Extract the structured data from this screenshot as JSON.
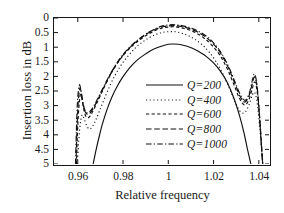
{
  "chart_data": {
    "type": "line",
    "title": "",
    "xlabel": "Relative frequency",
    "ylabel": "Insertion loss in dB",
    "xlim": [
      0.9495,
      1.0445
    ],
    "ylim": [
      0,
      5
    ],
    "y_inverted": true,
    "grid": false,
    "legend_position": "center",
    "xticks": [
      {
        "value": 0.96,
        "label": "0.96"
      },
      {
        "value": 0.98,
        "label": "0.98"
      },
      {
        "value": 1.0,
        "label": "1"
      },
      {
        "value": 1.02,
        "label": "1.02"
      },
      {
        "value": 1.04,
        "label": "1.04"
      }
    ],
    "yticks": [
      {
        "value": 0,
        "label": "0"
      },
      {
        "value": 0.5,
        "label": "0.5"
      },
      {
        "value": 1,
        "label": "1"
      },
      {
        "value": 1.5,
        "label": "1.5"
      },
      {
        "value": 2,
        "label": "2"
      },
      {
        "value": 2.5,
        "label": "2.5"
      },
      {
        "value": 3,
        "label": "3"
      },
      {
        "value": 3.5,
        "label": "3.5"
      },
      {
        "value": 4,
        "label": "4"
      },
      {
        "value": 4.5,
        "label": "4.5"
      },
      {
        "value": 5,
        "label": "5"
      }
    ],
    "series": [
      {
        "name": "Q=200",
        "label": "Q=200",
        "dash": "none",
        "color": "#111111",
        "x": [
          0.9668,
          0.968,
          0.9695,
          0.971,
          0.973,
          0.975,
          0.9775,
          0.98,
          0.983,
          0.986,
          0.989,
          0.992,
          0.995,
          0.998,
          1.0,
          1.002,
          1.0045,
          1.007,
          1.0095,
          1.012,
          1.0145,
          1.017,
          1.02,
          1.023,
          1.026,
          1.029,
          1.0315,
          1.0335,
          1.035,
          1.0365
        ],
        "y": [
          5.0,
          4.55,
          4.05,
          3.6,
          3.12,
          2.72,
          2.33,
          2.01,
          1.7,
          1.46,
          1.28,
          1.13,
          1.02,
          0.94,
          0.9,
          0.89,
          0.9,
          0.94,
          1.0,
          1.09,
          1.2,
          1.33,
          1.54,
          1.82,
          2.2,
          2.75,
          3.35,
          3.95,
          4.5,
          5.0
        ]
      },
      {
        "name": "Q=400",
        "label": "Q=400",
        "dash": "dotted",
        "color": "#111111",
        "x": [
          0.9598,
          0.9603,
          0.9608,
          0.9614,
          0.962,
          0.9628,
          0.9638,
          0.965,
          0.9663,
          0.9678,
          0.9695,
          0.9715,
          0.974,
          0.9765,
          0.979,
          0.982,
          0.985,
          0.988,
          0.991,
          0.994,
          0.997,
          1.0,
          1.003,
          1.006,
          1.009,
          1.012,
          1.015,
          1.018,
          1.021,
          1.024,
          1.027,
          1.0295,
          1.032,
          1.034,
          1.0358,
          1.0372,
          1.0382,
          1.039,
          1.0398,
          1.0405,
          1.0412,
          1.0418
        ],
        "y": [
          5.0,
          4.35,
          3.85,
          3.48,
          3.32,
          3.45,
          3.66,
          3.8,
          3.74,
          3.52,
          3.2,
          2.82,
          2.35,
          1.96,
          1.63,
          1.32,
          1.06,
          0.86,
          0.7,
          0.58,
          0.5,
          0.47,
          0.47,
          0.52,
          0.61,
          0.74,
          0.92,
          1.16,
          1.48,
          1.9,
          2.4,
          2.88,
          3.22,
          3.22,
          2.95,
          2.62,
          2.55,
          2.78,
          3.25,
          3.85,
          4.45,
          5.0
        ]
      },
      {
        "name": "Q=600",
        "label": "Q=600",
        "dash": "short",
        "color": "#111111",
        "x": [
          0.9594,
          0.9598,
          0.9602,
          0.9607,
          0.9612,
          0.9618,
          0.9625,
          0.9633,
          0.9643,
          0.9655,
          0.967,
          0.969,
          0.9715,
          0.9745,
          0.9775,
          0.9805,
          0.984,
          0.9875,
          0.991,
          0.9945,
          0.9975,
          1.0,
          1.0025,
          1.0055,
          1.009,
          1.0125,
          1.016,
          1.0195,
          1.023,
          1.0262,
          1.029,
          1.0315,
          1.0337,
          1.0355,
          1.037,
          1.038,
          1.0388,
          1.0396,
          1.0404,
          1.0411,
          1.0417
        ],
        "y": [
          5.0,
          4.1,
          3.4,
          2.88,
          2.62,
          2.75,
          3.06,
          3.32,
          3.42,
          3.35,
          3.14,
          2.82,
          2.4,
          1.93,
          1.55,
          1.24,
          0.96,
          0.74,
          0.56,
          0.42,
          0.34,
          0.31,
          0.3,
          0.33,
          0.4,
          0.52,
          0.7,
          0.95,
          1.3,
          1.76,
          2.28,
          2.76,
          2.98,
          2.82,
          2.45,
          2.2,
          2.3,
          2.75,
          3.5,
          4.3,
          5.0
        ]
      },
      {
        "name": "Q=800",
        "label": "Q=800",
        "dash": "long",
        "color": "#111111",
        "x": [
          0.9592,
          0.9596,
          0.96,
          0.9605,
          0.961,
          0.9616,
          0.9623,
          0.9632,
          0.9643,
          0.9656,
          0.9672,
          0.9692,
          0.9718,
          0.9748,
          0.9778,
          0.981,
          0.9845,
          0.988,
          0.9915,
          0.9948,
          0.9975,
          1.0,
          1.0025,
          1.0058,
          1.0092,
          1.0128,
          1.0163,
          1.0198,
          1.0232,
          1.0264,
          1.0292,
          1.0317,
          1.0338,
          1.0356,
          1.037,
          1.038,
          1.0388,
          1.0396,
          1.0404,
          1.0411,
          1.0417
        ],
        "y": [
          5.0,
          3.95,
          3.15,
          2.62,
          2.4,
          2.58,
          2.94,
          3.2,
          3.3,
          3.24,
          3.05,
          2.74,
          2.33,
          1.88,
          1.5,
          1.18,
          0.9,
          0.68,
          0.5,
          0.37,
          0.3,
          0.27,
          0.26,
          0.29,
          0.36,
          0.47,
          0.64,
          0.88,
          1.22,
          1.68,
          2.2,
          2.68,
          2.88,
          2.68,
          2.28,
          2.02,
          2.15,
          2.62,
          3.42,
          4.25,
          5.0
        ]
      },
      {
        "name": "Q=1000",
        "label": "Q=1000",
        "dash": "dashdot",
        "color": "#111111",
        "x": [
          0.959,
          0.9594,
          0.9598,
          0.9603,
          0.9608,
          0.9614,
          0.9622,
          0.9631,
          0.9642,
          0.9656,
          0.9673,
          0.9693,
          0.9719,
          0.9749,
          0.978,
          0.9812,
          0.9847,
          0.9882,
          0.9917,
          0.995,
          0.9976,
          1.0,
          1.0026,
          1.0059,
          1.0093,
          1.0129,
          1.0164,
          1.0199,
          1.0233,
          1.0265,
          1.0293,
          1.0318,
          1.0339,
          1.0357,
          1.037,
          1.0379,
          1.0387,
          1.0395,
          1.0403,
          1.041,
          1.0417
        ],
        "y": [
          5.0,
          3.82,
          2.98,
          2.48,
          2.28,
          2.48,
          2.86,
          3.14,
          3.25,
          3.18,
          2.99,
          2.68,
          2.28,
          1.84,
          1.46,
          1.14,
          0.87,
          0.65,
          0.47,
          0.34,
          0.27,
          0.24,
          0.23,
          0.26,
          0.33,
          0.44,
          0.6,
          0.84,
          1.18,
          1.64,
          2.16,
          2.62,
          2.82,
          2.6,
          2.18,
          1.92,
          2.05,
          2.55,
          3.38,
          4.22,
          5.0
        ]
      }
    ]
  }
}
